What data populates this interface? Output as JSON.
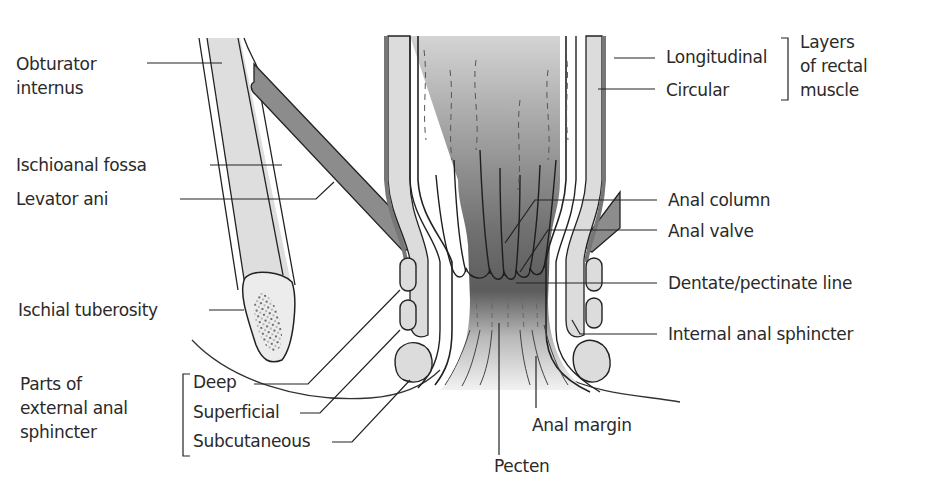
{
  "diagram": {
    "colors": {
      "light_tissue": "#dcdcdc",
      "muscle_dark": "#8a8a8a",
      "lumen_top": "#cfcfcf",
      "lumen_dark": "#5a5a5a",
      "outline": "#222222",
      "text": "#2a2a2a"
    },
    "labels_left": {
      "obturator_internus": "Obturator\ninternus",
      "ischioanal_fossa": "Ischioanal fossa",
      "levator_ani": "Levator ani",
      "ischial_tuberosity": "Ischial tuberosity",
      "external_group": "Parts of\nexternal anal\nsphincter",
      "deep": "Deep",
      "superficial": "Superficial",
      "subcutaneous": "Subcutaneous"
    },
    "labels_right": {
      "longitudinal": "Longitudinal",
      "circular": "Circular",
      "rectal_group": "Layers\nof rectal\nmuscle",
      "anal_column": "Anal column",
      "anal_valve": "Anal valve",
      "dentate_line": "Dentate/pectinate line",
      "internal_sphincter": "Internal anal sphincter"
    },
    "labels_bottom": {
      "anal_margin": "Anal margin",
      "pecten": "Pecten"
    }
  }
}
